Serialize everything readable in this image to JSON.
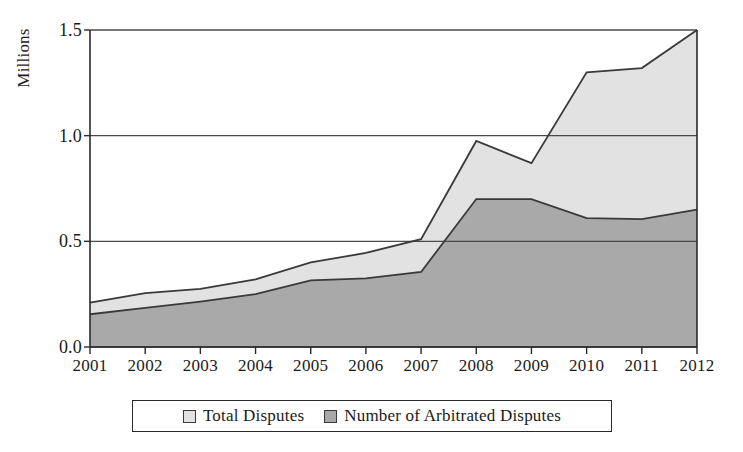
{
  "chart_data": {
    "type": "area",
    "title": "",
    "subtitle": "",
    "xlabel": "",
    "ylabel": "Millions",
    "categories": [
      "2001",
      "2002",
      "2003",
      "2004",
      "2005",
      "2006",
      "2007",
      "2008",
      "2009",
      "2010",
      "2011",
      "2012"
    ],
    "ylim": [
      0.0,
      1.5
    ],
    "yticks": [
      "0.0",
      "0.5",
      "1.0",
      "1.5"
    ],
    "ytick_values": [
      0.0,
      0.5,
      1.0,
      1.5
    ],
    "grid": true,
    "grid_axis": "y",
    "legend_position": "bottom",
    "stacked": false,
    "series": [
      {
        "name": "Total Disputes",
        "color": "#e2e2e2",
        "line_color": "#3a3a3a",
        "values": [
          0.21,
          0.255,
          0.275,
          0.32,
          0.4,
          0.445,
          0.51,
          0.975,
          0.87,
          1.3,
          1.32,
          1.5
        ]
      },
      {
        "name": "Number of Arbitrated Disputes",
        "color": "#a9a9a9",
        "line_color": "#3a3a3a",
        "values": [
          0.155,
          0.185,
          0.215,
          0.25,
          0.315,
          0.325,
          0.355,
          0.7,
          0.7,
          0.61,
          0.605,
          0.65
        ]
      }
    ]
  },
  "legend": {
    "items": [
      {
        "label": "Total Disputes",
        "color": "#e2e2e2"
      },
      {
        "label": "Number of Arbitrated Disputes",
        "color": "#a9a9a9"
      }
    ]
  },
  "axis": {
    "y_title": "Millions"
  }
}
